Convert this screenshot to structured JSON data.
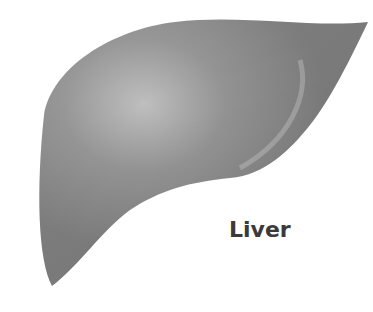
{
  "image": {
    "subject": "liver",
    "label": "Liver",
    "colors": {
      "background": "#ffffff",
      "organ_base": "#8a8a8a",
      "organ_highlight": "#c4c4c4",
      "organ_shadow": "#6e6e6e",
      "label": "#3a3a3a"
    }
  }
}
